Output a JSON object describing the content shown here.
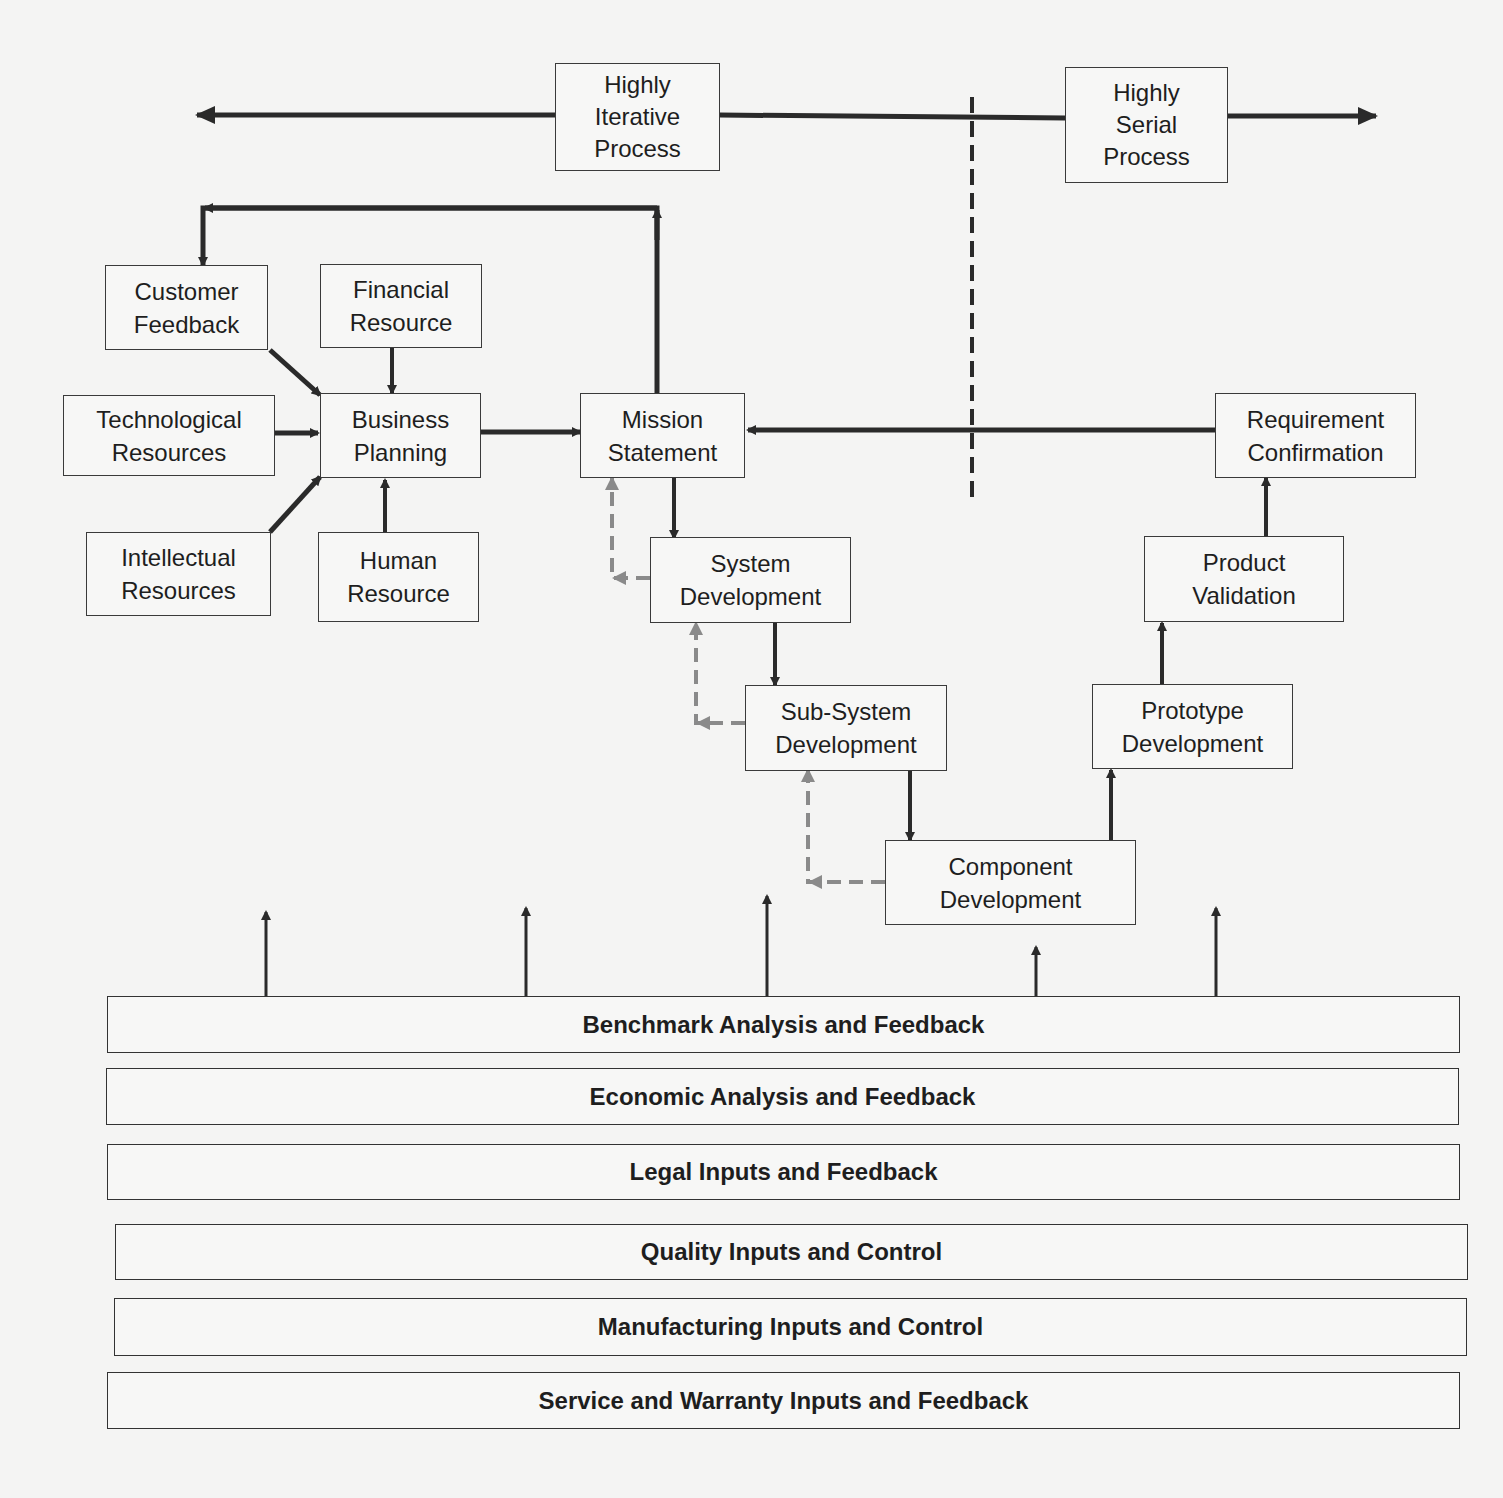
{
  "diagram": {
    "colors": {
      "line": "#2a2a2a",
      "feedback_dashed": "#8a8a8a",
      "background": "#f4f4f3"
    },
    "spectrum": {
      "left_label": "Highly\nIterative\nProcess",
      "right_label": "Highly\nSerial\nProcess"
    },
    "nodes": {
      "customer_feedback": "Customer\nFeedback",
      "financial_resource": "Financial\nResource",
      "technological_resources": "Technological\nResources",
      "business_planning": "Business\nPlanning",
      "intellectual_resources": "Intellectual\nResources",
      "human_resource": "Human\nResource",
      "mission_statement": "Mission\nStatement",
      "requirement_confirmation": "Requirement\nConfirmation",
      "system_development": "System\nDevelopment",
      "product_validation": "Product\nValidation",
      "subsystem_development": "Sub-System\nDevelopment",
      "prototype_development": "Prototype\nDevelopment",
      "component_development": "Component\nDevelopment"
    },
    "bands": [
      "Benchmark Analysis and Feedback",
      "Economic Analysis and Feedback",
      "Legal Inputs and Feedback",
      "Quality Inputs and Control",
      "Manufacturing Inputs and Control",
      "Service and Warranty Inputs and Feedback"
    ]
  }
}
